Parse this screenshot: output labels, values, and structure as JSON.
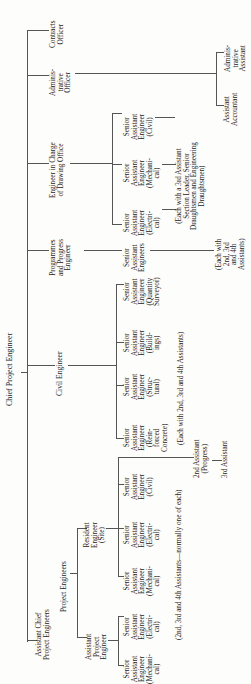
{
  "chart": {
    "title": "Chief Project Engineer",
    "orientation": "rotated-90-ccw",
    "root": {
      "label": "Chief Project Engineer",
      "children": [
        {
          "id": "contracts",
          "label": "Contracts\nOfficer"
        },
        {
          "id": "admin",
          "label": "Adminis-\ntrative\nOfficer",
          "children": [
            {
              "id": "admin_asst",
              "label": "Adminis-\ntrative\nAssistant"
            },
            {
              "id": "asst_acct",
              "label": "Assistant\nAccountant"
            }
          ]
        },
        {
          "id": "drawing",
          "label": "Engineer in Charge\nof Drawing Office",
          "children": [
            {
              "id": "d_civil",
              "label": "Senior\nAssistant\nEngineer\n(Civil)"
            },
            {
              "id": "d_mech",
              "label": "Senior\nAssistant\nEngineer\n(Mechani-\ncal)"
            },
            {
              "id": "d_elec",
              "label": "Senior\nAssistant\nEngineer\n(Electri-\ncal)"
            }
          ],
          "note": "(Each with a 3rd Assistant\nSection Leader, Senior\nDraughtsmen and Engineering\nDraughtsmen)"
        },
        {
          "id": "progress",
          "label": "Programmes\nand Progress\nEngineer",
          "children": [
            {
              "id": "p_sae",
              "label": "Senior\nAssistant\nEngineers"
            }
          ],
          "note": "(Each with\n2nd, 3rd\nand 4th\nAssistants)"
        },
        {
          "id": "civil",
          "label": "Civil Engineer",
          "children": [
            {
              "id": "c_qs",
              "label": "Senior\nAssistant\nEngineer\n(Quantity\nSurveyor)"
            },
            {
              "id": "c_build",
              "label": "Senior\nAssistant\nEngineer\n(Build-\nings)"
            },
            {
              "id": "c_struct",
              "label": "Senior\nAssistant\nEngineer\n(Struc-\ntural)"
            },
            {
              "id": "c_rc",
              "label": "Senior\nAssistant\nEngineer\n(Rein-\nforced\nConcrete)"
            }
          ],
          "note": "(Each with 2nd, 3rd and 4th Assistants)"
        },
        {
          "id": "acpe",
          "label": "Assistant Chief\nProject Engineers",
          "children": [
            {
              "id": "pe",
              "label": "Project Engineers",
              "children": [
                {
                  "id": "resident",
                  "label": "Resident\nEngineer\n(Site)",
                  "children": [
                    {
                      "id": "r_civil",
                      "label": "Senior\nAssistant\nEngineer\n(Civil)"
                    },
                    {
                      "id": "r_elec",
                      "label": "Senior\nAssistant\nEngineer\n(Electri-\ncal)"
                    },
                    {
                      "id": "r_mech",
                      "label": "Senior\nAssistant\nEngineer\n(Mechani-\ncal)"
                    }
                  ],
                  "note": "(2nd, 3rd and 4th Assistants—normally one of each)",
                  "extra": [
                    {
                      "label": "2nd Assistant\n(Progress)"
                    },
                    {
                      "label": "3rd Assistant"
                    }
                  ]
                },
                {
                  "id": "ape",
                  "label": "Assistant\nProject\nEngineer",
                  "children": [
                    {
                      "id": "a_elec",
                      "label": "Senior\nAssistant\nEngineer\n(Electri-\ncal)"
                    },
                    {
                      "id": "a_mech",
                      "label": "Senior\nAssistant\nEngineer\n(Mechani-\ncal)"
                    }
                  ]
                }
              ]
            }
          ]
        }
      ]
    }
  },
  "labels": {
    "chief": "Chief Project Engineer",
    "contracts": "Contracts\nOfficer",
    "admin": "Adminis-\ntrative\nOfficer",
    "admin_asst": "Adminis-\ntrative\nAssistant",
    "asst_acct": "Assistant\nAccountant",
    "drawing": "Engineer in Charge\nof Drawing Office",
    "d_civil": "Senior\nAssistant\nEngineer\n(Civil)",
    "d_mech": "Senior\nAssistant\nEngineer\n(Mechani-\ncal)",
    "d_elec": "Senior\nAssistant\nEngineer\n(Electri-\ncal)",
    "d_note": "(Each with a 3rd Assistant\nSection Leader, Senior\nDraughtsmen and Engineering\nDraughtsmen)",
    "progress": "Programmes\nand Progress\nEngineer",
    "p_sae": "Senior\nAssistant\nEngineers",
    "p_note": "(Each with\n2nd, 3rd\nand 4th\nAssistants)",
    "civil": "Civil Engineer",
    "c_qs": "Senior\nAssistant\nEngineer\n(Quantity\nSurveyor)",
    "c_build": "Senior\nAssistant\nEngineer\n(Build-\nings)",
    "c_struct": "Senior\nAssistant\nEngineer\n(Struc-\ntural)",
    "c_rc": "Senior\nAssistant\nEngineer\n(Rein-\nforced\nConcrete)",
    "c_note": "(Each with 2nd, 3rd and 4th Assistants)",
    "acpe": "Assistant Chief\nProject Engineers",
    "pe": "Project Engineers",
    "resident": "Resident\nEngineer\n(Site)",
    "r_civil": "Senior\nAssistant\nEngineer\n(Civil)",
    "r_elec": "Senior\nAssistant\nEngineer\n(Electri-\ncal)",
    "r_mech": "Senior\nAssistant\nEngineer\n(Mechani-\ncal)",
    "r_note": "(2nd, 3rd and 4th Assistants—normally one of each)",
    "second_asst": "2nd Assistant\n(Progress)",
    "third_asst": "3rd Assistant",
    "ape": "Assistant\nProject\nEngineer",
    "a_elec": "Senior\nAssistant\nEngineer\n(Electri-\ncal)",
    "a_mech": "Senior\nAssistant\nEngineer\n(Mechani-\ncal)"
  }
}
